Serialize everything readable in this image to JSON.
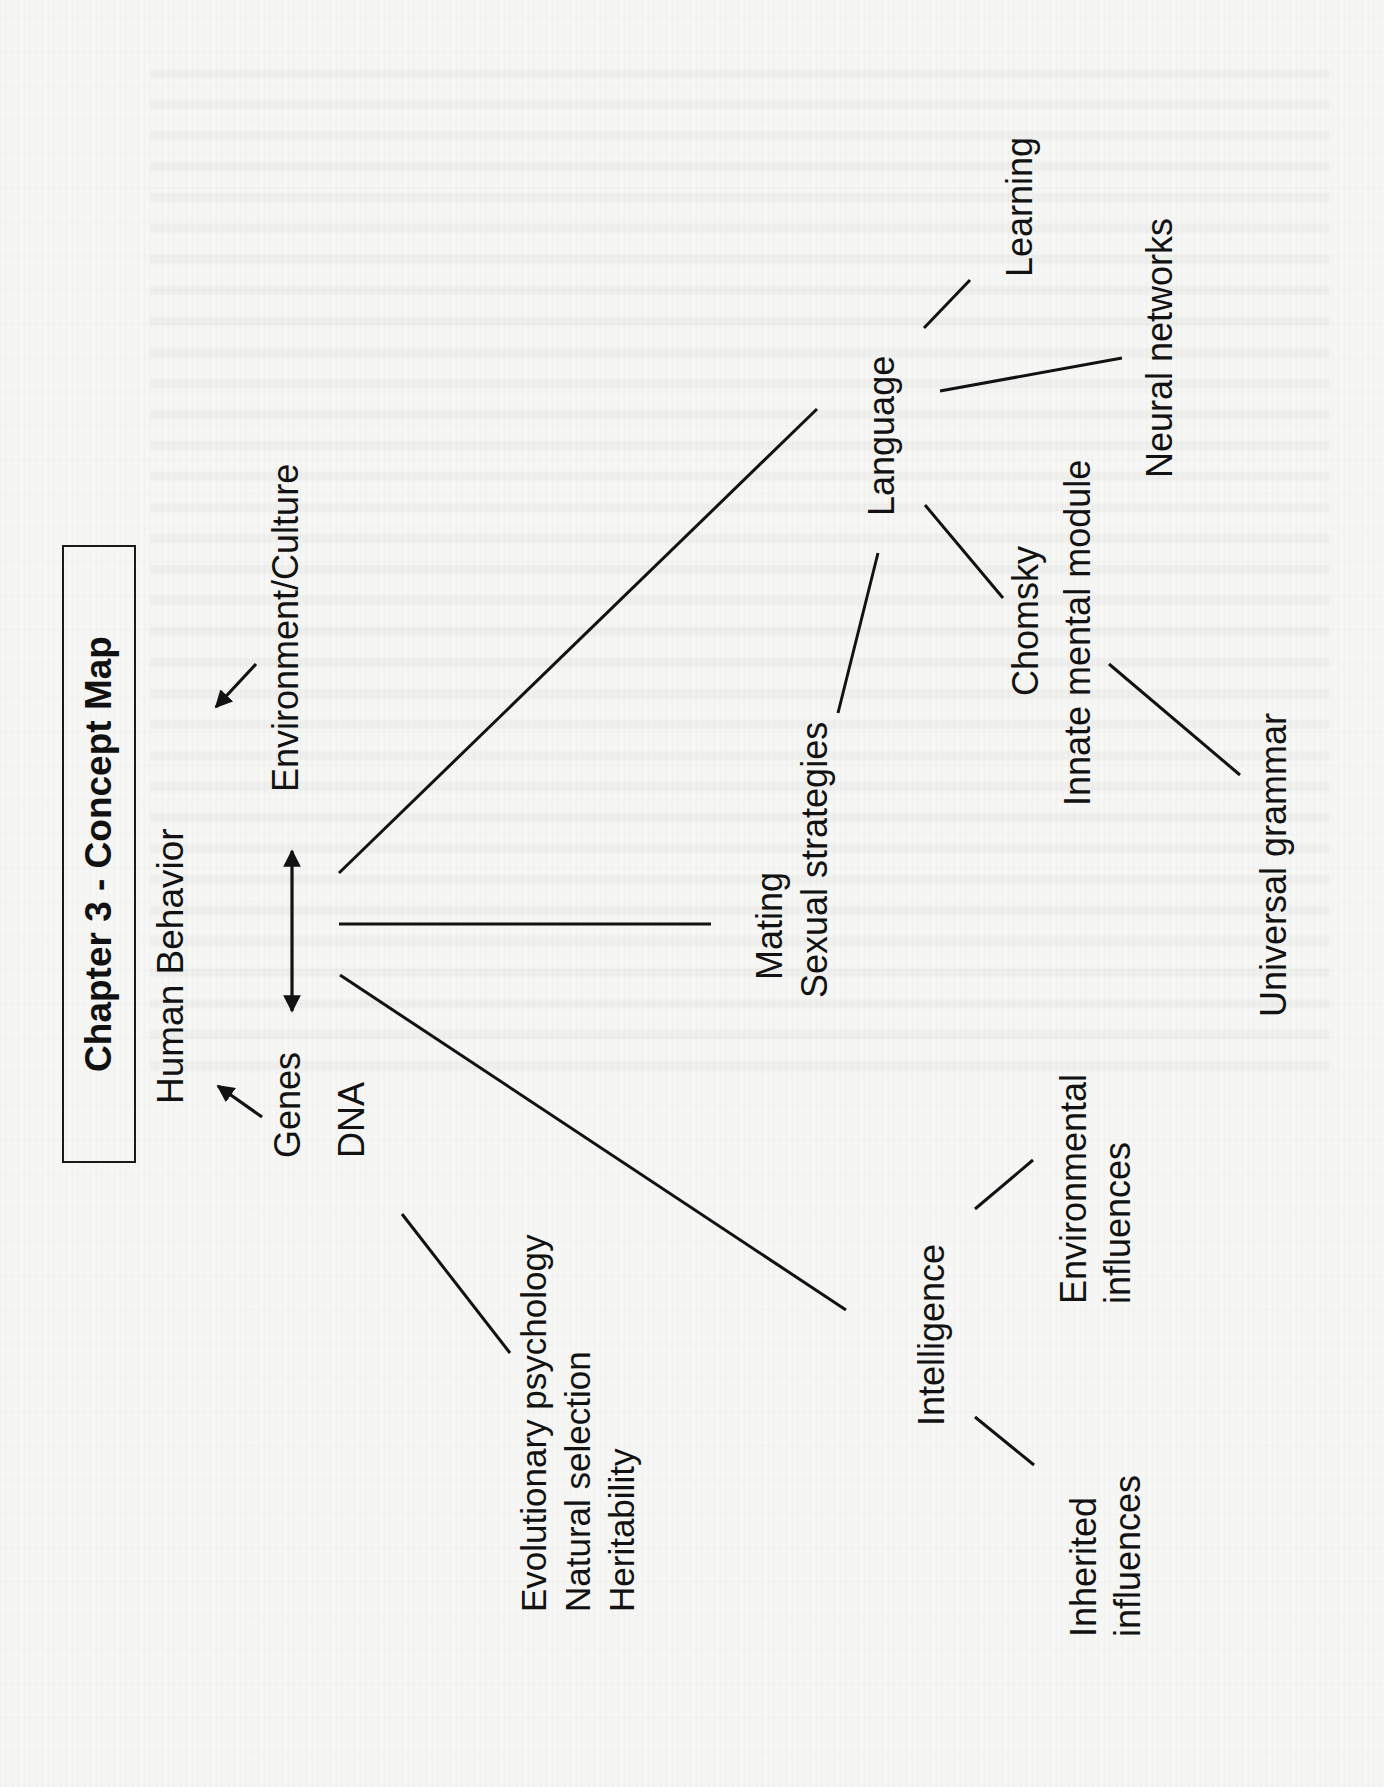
{
  "document": {
    "title": "Chapter 3 - Concept Map",
    "orientation": "rotated 90 degrees counter-clockwise"
  },
  "nodes": {
    "human_behavior": "Human Behavior",
    "environment_culture": "Environment/Culture",
    "genes": "Genes",
    "dna": "DNA",
    "evolution_group": "Evolutionary psychology\nNatural selection\nHeritability",
    "mating": "Mating",
    "sexual_strategies": "Sexual strategies",
    "language": "Language",
    "learning": "Learning",
    "neural_networks": "Neural networks",
    "chomsky": "Chomsky",
    "innate_mental_module": "Innate mental module",
    "universal_grammar": "Universal grammar",
    "intelligence": "Intelligence",
    "environmental_influences": "Environmental\ninfluences",
    "inherited_influences": "Inherited\ninfluences"
  },
  "edges": [
    {
      "from": "Environment/Culture",
      "to": "Human Behavior",
      "type": "arrow",
      "x1": 256,
      "y1": 664,
      "x2": 216,
      "y2": 707
    },
    {
      "from": "Genes",
      "to": "Human Behavior",
      "type": "arrow",
      "x1": 262,
      "y1": 1117,
      "x2": 218,
      "y2": 1086
    },
    {
      "from": "Genes",
      "to": "Environment/Culture",
      "type": "double-arrow",
      "x1": 292,
      "y1": 1011,
      "x2": 292,
      "y2": 851
    },
    {
      "from": "Genes",
      "to": "Mating",
      "type": "line",
      "x1": 339,
      "y1": 924,
      "x2": 711,
      "y2": 924
    },
    {
      "from": "Genes",
      "to": "Language",
      "type": "line",
      "x1": 339,
      "y1": 873,
      "x2": 817,
      "y2": 409
    },
    {
      "from": "DNA",
      "to": "Intelligence",
      "type": "line",
      "x1": 340,
      "y1": 975,
      "x2": 846,
      "y2": 1310
    },
    {
      "from": "DNA",
      "to": "Evolutionary psychology",
      "type": "line",
      "x1": 402,
      "y1": 1214,
      "x2": 510,
      "y2": 1353
    },
    {
      "from": "Sexual strategies",
      "to": "Language",
      "type": "line",
      "x1": 838,
      "y1": 713,
      "x2": 878,
      "y2": 553
    },
    {
      "from": "Language",
      "to": "Learning",
      "type": "line",
      "x1": 924,
      "y1": 328,
      "x2": 970,
      "y2": 280
    },
    {
      "from": "Language",
      "to": "Neural networks",
      "type": "line",
      "x1": 940,
      "y1": 391,
      "x2": 1122,
      "y2": 358
    },
    {
      "from": "Language",
      "to": "Chomsky",
      "type": "line",
      "x1": 925,
      "y1": 505,
      "x2": 1003,
      "y2": 598
    },
    {
      "from": "Innate mental module",
      "to": "Universal grammar",
      "type": "line",
      "x1": 1109,
      "y1": 664,
      "x2": 1240,
      "y2": 775
    },
    {
      "from": "Intelligence",
      "to": "Environmental influences",
      "type": "line",
      "x1": 975,
      "y1": 1209,
      "x2": 1033,
      "y2": 1160
    },
    {
      "from": "Intelligence",
      "to": "Inherited influences",
      "type": "line",
      "x1": 975,
      "y1": 1417,
      "x2": 1034,
      "y2": 1465
    }
  ],
  "colors": {
    "ink": "#121212",
    "paper": "#f6f6f4"
  }
}
